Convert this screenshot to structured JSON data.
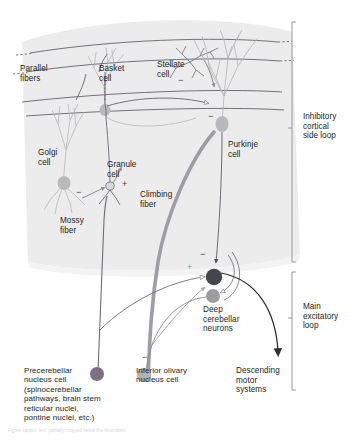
{
  "figure": {
    "background": "#ffffff",
    "cortex_fill": "#ececed",
    "colors": {
      "line_dark": "#4a4a52",
      "line_mid": "#6d6d75",
      "neuron_gray": "#a8a8ab",
      "climbing_fiber": "#9a9a9e",
      "deep_nucleus_dark": "#45454d",
      "deep_nucleus_light": "#9d9da0",
      "precerebellar_cell": "#7b7280",
      "inferior_olivary_cell": "#b2b2b4",
      "text": "#231f20"
    }
  },
  "labels": {
    "parallel_fibers": "Parallel\nfibers",
    "basket_cell": "Basket\ncell",
    "stellate_cell": "Stellate\ncell",
    "purkinje_cell": "Purkinje\ncell",
    "golgi_cell": "Golgi\ncell",
    "granule_cell": "Granule\ncell",
    "climbing_fiber": "Climbing\nfiber",
    "mossy_fiber": "Mossy\nfiber",
    "deep_cerebellar_neurons": "Deep\ncerebellar\nneurons",
    "precerebellar_nucleus_cell": "Precerebellar\nnucleus cell\n(spinocerebellar\npathways, brain stem\nreticular nuclei,\npontine nuclei, etc.)",
    "inferior_olivary_nucleus_cell": "Inferior olivary\nnucleus cell",
    "descending_motor_systems": "Descending\nmotor\nsystems"
  },
  "brackets": {
    "upper": "Inhibitory\ncortical\nside loop",
    "lower": "Main\nexcitatory\nloop"
  },
  "synapse_signs": {
    "stellate_to_purkinje": "−",
    "basket_to_purkinje": "−",
    "golgi_to_granule": "−",
    "granule_excitatory": "+",
    "purkinje_to_deep": "−",
    "mossy_to_deep": "+",
    "deep_to_olive": "−"
  },
  "caption_text": "Figure caption text, partially cropped below the illustration."
}
